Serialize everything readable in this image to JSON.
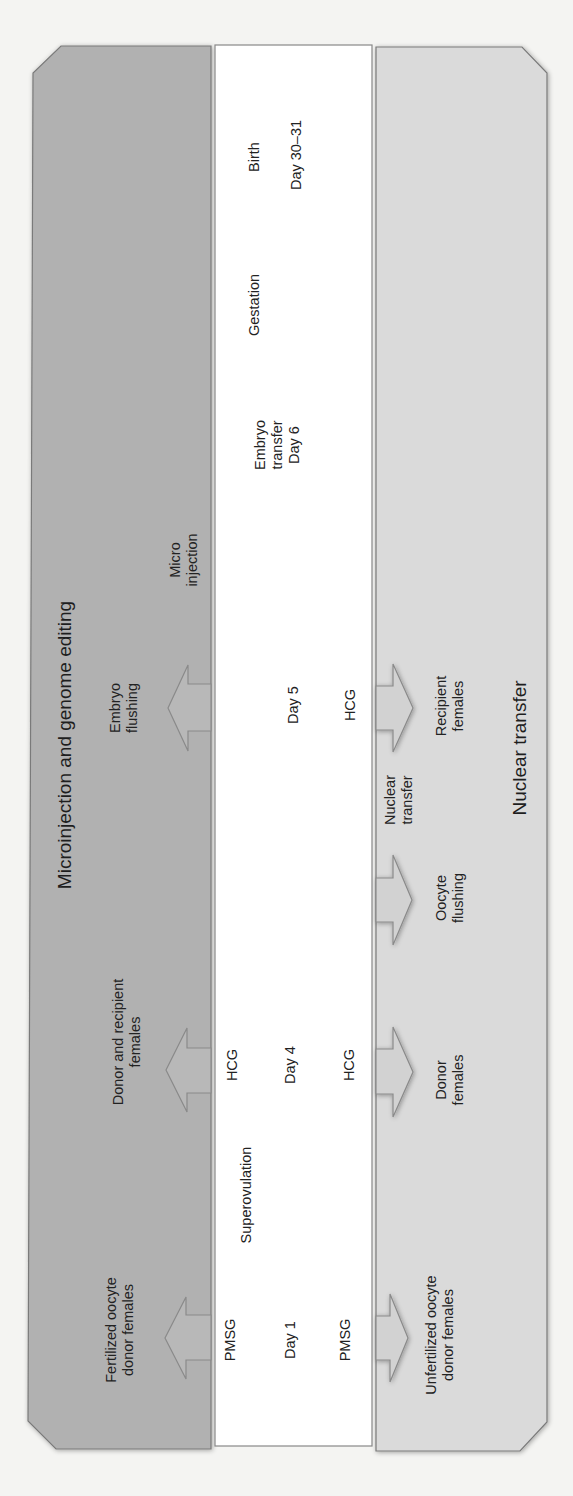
{
  "colors": {
    "left_panel": "#b1b1b1",
    "middle_panel": "#ffffff",
    "right_panel": "#dadada",
    "border": "#777777",
    "text": "#222222"
  },
  "orientation": "rotated -90deg (text reads bottom-to-top); timeline runs from bottom (Day 1) to top (Day 30-31)",
  "left_panel": {
    "title": "Microinjection and genome editing",
    "labels": {
      "fertilized_donors": "Fertilized oocyte\ndonor females",
      "donor_recipient": "Donor and recipient\nfemales",
      "embryo_flushing": "Embryo\nflushing",
      "microinjection": "Micro\ninjection"
    }
  },
  "middle_panel": {
    "labels": {
      "birth": "Birth",
      "day_30_31": "Day 30–31",
      "gestation": "Gestation",
      "embryo_transfer": "Embryo\ntransfer\nDay 6",
      "day5": "Day 5",
      "hcg_day5": "HCG",
      "hcg_day4_left": "HCG",
      "day4": "Day 4",
      "hcg_day4_right": "HCG",
      "superovulation": "Superovulation",
      "pmsg_left": "PMSG",
      "day1": "Day 1",
      "pmsg_right": "PMSG"
    }
  },
  "right_panel": {
    "title": "Nuclear transfer",
    "labels": {
      "unfertilized_donors": "Unfertilized oocyte\ndonor females",
      "donor_females": "Donor\nfemales",
      "oocyte_flushing": "Oocyte\nflushing",
      "nuclear_transfer": "Nuclear\ntransfer",
      "recipient_females": "Recipient\nfemales"
    }
  },
  "arrows": [
    {
      "panel": "left",
      "direction": "toward-left-panel",
      "at": "Day 1"
    },
    {
      "panel": "left",
      "direction": "toward-left-panel",
      "at": "Day 4"
    },
    {
      "panel": "left",
      "direction": "toward-left-panel",
      "at": "Day 5"
    },
    {
      "panel": "right",
      "direction": "toward-right-panel",
      "at": "Day 1"
    },
    {
      "panel": "right",
      "direction": "toward-right-panel",
      "at": "Day 4"
    },
    {
      "panel": "right",
      "direction": "toward-right-panel",
      "at": "Oocyte flushing"
    },
    {
      "panel": "right",
      "direction": "toward-right-panel",
      "at": "Day 5"
    }
  ]
}
